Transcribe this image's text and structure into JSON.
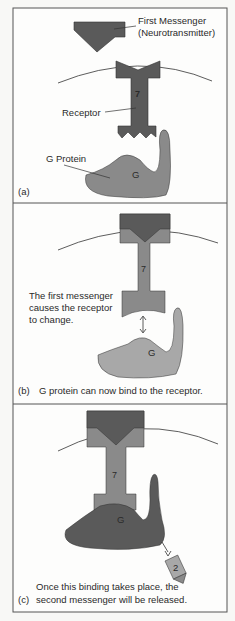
{
  "figure": {
    "panels": [
      {
        "id": "a",
        "panel_label": "(a)",
        "labels": {
          "first_messenger_line1": "First Messenger",
          "first_messenger_line2": "(Neurotransmitter)",
          "receptor": "Receptor",
          "receptor_number": "7",
          "g_protein": "G Protein",
          "g": "G"
        }
      },
      {
        "id": "b",
        "panel_label": "(b)",
        "caption": "G protein can now bind to the receptor.",
        "labels": {
          "note_line1": "The first messenger",
          "note_line2": "causes the receptor",
          "note_line3": "to change.",
          "receptor_number": "7",
          "g": "G"
        }
      },
      {
        "id": "c",
        "panel_label": "(c)",
        "caption_line1": "Once this binding takes place, the",
        "caption_line2": "second messenger will be released.",
        "labels": {
          "receptor_number": "7",
          "g": "G",
          "second_messenger": "2"
        }
      }
    ],
    "colors": {
      "dark": "#5a5a5a",
      "medium": "#8a8a8a",
      "light": "#a8a8a8",
      "border": "#555555"
    }
  }
}
